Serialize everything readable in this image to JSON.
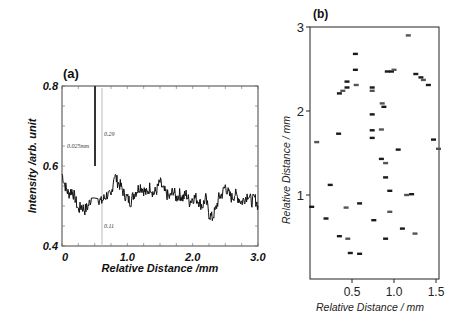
{
  "chart_data": [
    {
      "panel": "(a)",
      "type": "line",
      "title": "",
      "xlabel": "Relative Distance /mm",
      "ylabel": "Intensity /arb. unit",
      "xlim": [
        0,
        3.0
      ],
      "ylim": [
        0.4,
        0.8
      ],
      "xticks": [
        "0",
        "1.0",
        "2.0",
        "3.0"
      ],
      "yticks": [
        "0.4",
        "0.6",
        "0.8"
      ],
      "grid": false,
      "annotations": [
        {
          "text": "0.025mm",
          "x": 0.05,
          "y": 0.65
        },
        {
          "text": "0.29",
          "x": 0.63,
          "y": 0.67
        },
        {
          "text": "0.11",
          "x": 0.63,
          "y": 0.46
        }
      ],
      "spike": {
        "x": 0.5,
        "y_top": 0.8
      },
      "marker_line_x": 0.63,
      "series": [
        {
          "name": "profile",
          "x": [
            0.0,
            0.05,
            0.1,
            0.15,
            0.2,
            0.25,
            0.3,
            0.35,
            0.4,
            0.45,
            0.5,
            0.55,
            0.6,
            0.65,
            0.7,
            0.75,
            0.8,
            0.85,
            0.9,
            0.95,
            1.0,
            1.05,
            1.1,
            1.15,
            1.2,
            1.25,
            1.3,
            1.35,
            1.4,
            1.45,
            1.5,
            1.55,
            1.6,
            1.65,
            1.7,
            1.75,
            1.8,
            1.85,
            1.9,
            1.95,
            2.0,
            2.05,
            2.1,
            2.15,
            2.2,
            2.25,
            2.3,
            2.35,
            2.4,
            2.45,
            2.5,
            2.55,
            2.6,
            2.65,
            2.7,
            2.75,
            2.8,
            2.85,
            2.9,
            2.95,
            3.0
          ],
          "values": [
            0.58,
            0.55,
            0.53,
            0.54,
            0.52,
            0.49,
            0.5,
            0.49,
            0.5,
            0.52,
            0.8,
            0.52,
            0.51,
            0.52,
            0.53,
            0.52,
            0.58,
            0.56,
            0.55,
            0.53,
            0.52,
            0.51,
            0.53,
            0.54,
            0.55,
            0.54,
            0.53,
            0.55,
            0.53,
            0.54,
            0.56,
            0.54,
            0.53,
            0.52,
            0.54,
            0.52,
            0.53,
            0.52,
            0.53,
            0.51,
            0.52,
            0.52,
            0.51,
            0.5,
            0.52,
            0.48,
            0.47,
            0.49,
            0.52,
            0.53,
            0.55,
            0.53,
            0.52,
            0.53,
            0.52,
            0.51,
            0.52,
            0.53,
            0.51,
            0.52,
            0.5
          ]
        }
      ]
    },
    {
      "panel": "(b)",
      "type": "scatter",
      "title": "",
      "xlabel": "Relative Distance / mm",
      "ylabel": "Relative Distance / mm",
      "xlim": [
        0,
        1.55
      ],
      "ylim": [
        0,
        3
      ],
      "xticks": [
        "0.5",
        "1.0",
        "1.5"
      ],
      "yticks": [
        "1",
        "2",
        "3"
      ],
      "grid": false,
      "marker": "short horizontal dash",
      "points": [
        {
          "x": 1.17,
          "y": 2.9
        },
        {
          "x": 0.54,
          "y": 2.68
        },
        {
          "x": 0.54,
          "y": 2.49
        },
        {
          "x": 0.55,
          "y": 2.31
        },
        {
          "x": 0.44,
          "y": 2.35
        },
        {
          "x": 0.44,
          "y": 2.28
        },
        {
          "x": 0.39,
          "y": 2.24
        },
        {
          "x": 0.35,
          "y": 2.21
        },
        {
          "x": 0.74,
          "y": 2.28
        },
        {
          "x": 0.74,
          "y": 2.24
        },
        {
          "x": 0.92,
          "y": 2.47
        },
        {
          "x": 0.97,
          "y": 2.47
        },
        {
          "x": 1.0,
          "y": 2.49
        },
        {
          "x": 1.32,
          "y": 2.4
        },
        {
          "x": 1.26,
          "y": 2.44
        },
        {
          "x": 1.35,
          "y": 2.37
        },
        {
          "x": 1.41,
          "y": 2.31
        },
        {
          "x": 0.88,
          "y": 2.05
        },
        {
          "x": 0.86,
          "y": 2.09
        },
        {
          "x": 0.74,
          "y": 1.96
        },
        {
          "x": 0.34,
          "y": 1.73
        },
        {
          "x": 0.08,
          "y": 1.63
        },
        {
          "x": 0.74,
          "y": 1.77
        },
        {
          "x": 0.74,
          "y": 1.68
        },
        {
          "x": 0.85,
          "y": 1.78
        },
        {
          "x": 1.05,
          "y": 1.54
        },
        {
          "x": 0.85,
          "y": 1.43
        },
        {
          "x": 0.9,
          "y": 1.38
        },
        {
          "x": 0.9,
          "y": 1.21
        },
        {
          "x": 0.95,
          "y": 1.05
        },
        {
          "x": 1.15,
          "y": 1.0
        },
        {
          "x": 1.21,
          "y": 1.01
        },
        {
          "x": 1.47,
          "y": 1.66
        },
        {
          "x": 1.53,
          "y": 1.55
        },
        {
          "x": 0.24,
          "y": 1.12
        },
        {
          "x": 0.02,
          "y": 0.86
        },
        {
          "x": 0.43,
          "y": 0.85
        },
        {
          "x": 0.59,
          "y": 0.9
        },
        {
          "x": 0.19,
          "y": 0.72
        },
        {
          "x": 0.95,
          "y": 0.8
        },
        {
          "x": 0.76,
          "y": 0.7
        },
        {
          "x": 0.35,
          "y": 0.51
        },
        {
          "x": 0.45,
          "y": 0.48
        },
        {
          "x": 0.9,
          "y": 0.48
        },
        {
          "x": 1.1,
          "y": 0.6
        },
        {
          "x": 1.25,
          "y": 0.54
        },
        {
          "x": 0.48,
          "y": 0.31
        },
        {
          "x": 0.59,
          "y": 0.3
        }
      ]
    }
  ],
  "labels": {
    "panel_a": "(a)",
    "panel_b": "(b)",
    "a_xlabel": "Relative Distance /mm",
    "a_ylabel": "Intensity /arb. unit",
    "b_xlabel": "Relative Distance / mm",
    "b_ylabel": "Relative Distance / mm",
    "annot_width": "0.025mm",
    "annot_029": "0.29",
    "annot_011": "0.11"
  }
}
